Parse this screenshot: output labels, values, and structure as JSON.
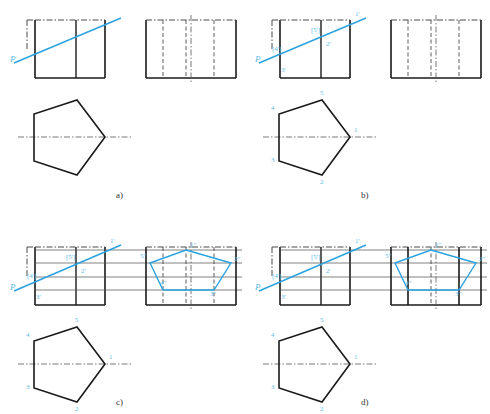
{
  "figure": {
    "background": "#ffffff",
    "colors": {
      "outline": "#1a1a1a",
      "accent_blue": "#2aa3e0",
      "label_blue": "#5bbbe8",
      "thin_black": "#4a4a4a",
      "center_line": "#555555",
      "caption": "#333333"
    },
    "panels": [
      {
        "id": "a",
        "caption": "a)",
        "caption_pos": {
          "x": 116,
          "y": 190
        },
        "description": "Front view box with oblique plane trace P and side view with hidden dash-dot lines; bottom pentagon top view unlabeled",
        "front_view": {
          "box": {
            "x": 35,
            "y": 20,
            "w": 70,
            "h": 58
          },
          "internal_vertical_x": 76,
          "top_dash_segments": true,
          "left_dash_extension": true
        },
        "plane_trace": {
          "label": "P",
          "label_pos": {
            "x": 10,
            "y": 62
          },
          "from": {
            "x": 14,
            "y": 63
          },
          "to": {
            "x": 121,
            "y": 18
          }
        },
        "side_view": {
          "box": {
            "x": 146,
            "y": 20,
            "w": 90,
            "h": 58
          },
          "dash_dot_vertical_x": [
            163,
            186,
            214
          ],
          "center_vertical_x": 191,
          "center_tick_below": true
        },
        "top_view_pentagon": {
          "center_line": {
            "x1": 18,
            "x2": 132,
            "y": 137
          },
          "vertices": [
            {
              "x": 105,
              "y": 137
            },
            {
              "x": 77,
              "y": 175
            },
            {
              "x": 34,
              "y": 161
            },
            {
              "x": 34,
              "y": 114
            },
            {
              "x": 77,
              "y": 100
            }
          ],
          "labels": []
        }
      },
      {
        "id": "b",
        "caption": "b)",
        "caption_pos": {
          "x": 361,
          "y": 190
        },
        "description": "Same as a) with vertices 1-5 labelled on pentagon and 1', 2', 3', [4'], [5'] on the front view trace",
        "front_view": {
          "box": {
            "x": 280,
            "y": 20,
            "w": 70,
            "h": 58
          },
          "internal_vertical_x": 321,
          "top_dash_segments": true,
          "left_dash_extension": true
        },
        "plane_trace": {
          "label": "P",
          "label_pos": {
            "x": 255,
            "y": 62
          },
          "from": {
            "x": 259,
            "y": 63
          },
          "to": {
            "x": 366,
            "y": 18
          }
        },
        "front_labels": [
          {
            "text": "1'",
            "x": 355,
            "y": 16
          },
          {
            "text": "[5']",
            "x": 311,
            "y": 32
          },
          {
            "text": "2'",
            "x": 326,
            "y": 46
          },
          {
            "text": "[4']",
            "x": 272,
            "y": 51
          },
          {
            "text": "3'",
            "x": 281,
            "y": 72
          }
        ],
        "side_view": {
          "box": {
            "x": 391,
            "y": 20,
            "w": 90,
            "h": 58
          },
          "dash_dot_vertical_x": [
            408,
            431,
            459
          ],
          "center_vertical_x": 436,
          "center_tick_below": true
        },
        "top_view_pentagon": {
          "center_line": {
            "x1": 263,
            "x2": 377,
            "y": 137
          },
          "vertices": [
            {
              "x": 350,
              "y": 137
            },
            {
              "x": 322,
              "y": 175
            },
            {
              "x": 279,
              "y": 161
            },
            {
              "x": 279,
              "y": 114
            },
            {
              "x": 322,
              "y": 100
            }
          ],
          "labels": [
            {
              "text": "1",
              "x": 354,
              "y": 132
            },
            {
              "text": "2",
              "x": 320,
              "y": 184
            },
            {
              "text": "3",
              "x": 271,
              "y": 162
            },
            {
              "text": "4",
              "x": 271,
              "y": 110
            },
            {
              "text": "5",
              "x": 320,
              "y": 95
            }
          ]
        }
      },
      {
        "id": "c",
        "caption": "c)",
        "caption_pos": {
          "x": 116,
          "y": 397
        },
        "description": "Projection lines carried to the side view where the true-shape blue pentagon 1\"-5\" is constructed; side view vertical lines remain dash-dot",
        "front_view": {
          "box": {
            "x": 35,
            "y": 247,
            "w": 70,
            "h": 58
          },
          "internal_vertical_x": 76,
          "top_dash_segments": true,
          "left_dash_extension": true
        },
        "plane_trace": {
          "label": "P",
          "label_pos": {
            "x": 10,
            "y": 290
          },
          "from": {
            "x": 14,
            "y": 291
          },
          "to": {
            "x": 121,
            "y": 245
          }
        },
        "front_labels": [
          {
            "text": "1'",
            "x": 110,
            "y": 243
          },
          {
            "text": "[5']",
            "x": 66,
            "y": 259
          },
          {
            "text": "2'",
            "x": 81,
            "y": 273
          },
          {
            "text": "[4']",
            "x": 27,
            "y": 278
          },
          {
            "text": "3'",
            "x": 36,
            "y": 299
          }
        ],
        "projection_lines_y": [
          250,
          263,
          277,
          290
        ],
        "side_view": {
          "box": {
            "x": 146,
            "y": 247,
            "w": 90,
            "h": 58
          },
          "dash_dot_vertical_x": [
            163,
            186,
            214
          ],
          "center_vertical_x": 191,
          "center_tick_below": true,
          "blue_solid": false
        },
        "side_polygon": {
          "vertices": [
            {
              "x": 186,
              "y": 250
            },
            {
              "x": 231,
              "y": 263
            },
            {
              "x": 214,
              "y": 290
            },
            {
              "x": 163,
              "y": 290
            },
            {
              "x": 150,
              "y": 263
            }
          ],
          "labels": [
            {
              "text": "1\"",
              "x": 190,
              "y": 247
            },
            {
              "text": "2\"",
              "x": 234,
              "y": 261
            },
            {
              "text": "3\"",
              "x": 210,
              "y": 296
            },
            {
              "text": "4\"",
              "x": 160,
              "y": 285
            },
            {
              "text": "5\"",
              "x": 140,
              "y": 258
            }
          ]
        },
        "top_view_pentagon": {
          "center_line": {
            "x1": 18,
            "x2": 132,
            "y": 364
          },
          "vertices": [
            {
              "x": 105,
              "y": 364
            },
            {
              "x": 77,
              "y": 402
            },
            {
              "x": 34,
              "y": 388
            },
            {
              "x": 34,
              "y": 341
            },
            {
              "x": 77,
              "y": 327
            }
          ],
          "labels": [
            {
              "text": "1",
              "x": 109,
              "y": 359
            },
            {
              "text": "2",
              "x": 75,
              "y": 411
            },
            {
              "text": "3",
              "x": 26,
              "y": 389
            },
            {
              "text": "4",
              "x": 26,
              "y": 337
            },
            {
              "text": "5",
              "x": 75,
              "y": 322
            }
          ]
        }
      },
      {
        "id": "d",
        "caption": "d)",
        "caption_pos": {
          "x": 361,
          "y": 397
        },
        "description": "Final result: the side view verticals bounding the cut become thick visible outlines and the blue section pentagon 1\"-5\" is finished",
        "front_view": {
          "box": {
            "x": 280,
            "y": 247,
            "w": 70,
            "h": 58
          },
          "internal_vertical_x": 321,
          "top_dash_segments": true,
          "left_dash_extension": true
        },
        "plane_trace": {
          "label": "P",
          "label_pos": {
            "x": 255,
            "y": 290
          },
          "from": {
            "x": 259,
            "y": 291
          },
          "to": {
            "x": 366,
            "y": 245
          }
        },
        "front_labels": [
          {
            "text": "1'",
            "x": 355,
            "y": 243
          },
          {
            "text": "[5']",
            "x": 311,
            "y": 259
          },
          {
            "text": "2'",
            "x": 326,
            "y": 273
          },
          {
            "text": "[4']",
            "x": 272,
            "y": 278
          },
          {
            "text": "3'",
            "x": 281,
            "y": 299
          }
        ],
        "projection_lines_y": [
          250,
          263,
          277,
          290
        ],
        "side_view": {
          "box": {
            "x": 391,
            "y": 247,
            "w": 90,
            "h": 58
          },
          "dash_dot_vertical_x": [
            431
          ],
          "center_vertical_x": 436,
          "solid_vertical_x": [
            408,
            459
          ],
          "center_tick_below": true,
          "blue_solid": true
        },
        "side_polygon": {
          "vertices": [
            {
              "x": 431,
              "y": 250
            },
            {
              "x": 476,
              "y": 263
            },
            {
              "x": 459,
              "y": 290
            },
            {
              "x": 408,
              "y": 290
            },
            {
              "x": 395,
              "y": 263
            }
          ],
          "labels": [
            {
              "text": "1\"",
              "x": 435,
              "y": 247
            },
            {
              "text": "2\"",
              "x": 479,
              "y": 261
            },
            {
              "text": "3\"",
              "x": 455,
              "y": 296
            },
            {
              "text": "4\"",
              "x": 405,
              "y": 285
            },
            {
              "text": "5\"",
              "x": 385,
              "y": 258
            }
          ]
        },
        "top_view_pentagon": {
          "center_line": {
            "x1": 263,
            "x2": 377,
            "y": 364
          },
          "vertices": [
            {
              "x": 350,
              "y": 364
            },
            {
              "x": 322,
              "y": 402
            },
            {
              "x": 279,
              "y": 388
            },
            {
              "x": 279,
              "y": 341
            },
            {
              "x": 322,
              "y": 327
            }
          ],
          "labels": [
            {
              "text": "1",
              "x": 354,
              "y": 359
            },
            {
              "text": "2",
              "x": 320,
              "y": 411
            },
            {
              "text": "3",
              "x": 271,
              "y": 389
            },
            {
              "text": "4",
              "x": 271,
              "y": 337
            },
            {
              "text": "5",
              "x": 320,
              "y": 322
            }
          ]
        }
      }
    ]
  }
}
